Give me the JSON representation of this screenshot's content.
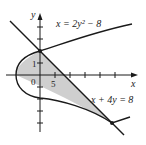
{
  "diagram": {
    "axis_x_label": "x",
    "axis_y_label": "y",
    "curve1_label": "x = 2y² − 8",
    "curve2_label": "x + 4y = 8",
    "tick_label_y": "1",
    "tick_label_x": "5",
    "origin_label": "0",
    "intersections": [
      [
        0,
        2
      ],
      [
        24,
        -4
      ]
    ],
    "colors": {
      "shade": "#cfcfcf",
      "stroke": "#1a1a1a"
    }
  }
}
